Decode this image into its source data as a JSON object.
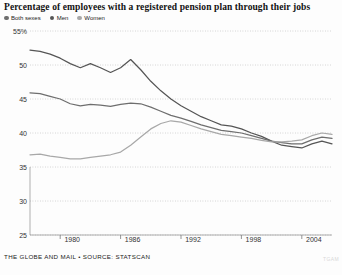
{
  "chart_data": {
    "type": "line",
    "title": "Percentage of employees with a registered pension plan through their jobs",
    "xlabel": "",
    "ylabel": "",
    "ylim": [
      25,
      55
    ],
    "xlim": [
      1977,
      2007
    ],
    "grid": true,
    "legend_position": "top-left",
    "yticks": [
      55,
      50,
      45,
      40,
      35,
      30,
      25
    ],
    "ytick_labels": [
      "55%",
      "50",
      "45",
      "40",
      "35",
      "30",
      "25"
    ],
    "xticks": [
      1980,
      1986,
      1992,
      1998,
      2004
    ],
    "xtick_labels": [
      "1980",
      "1986",
      "1992",
      "1998",
      "2004"
    ],
    "x": [
      1977,
      1978,
      1979,
      1980,
      1981,
      1982,
      1983,
      1984,
      1985,
      1986,
      1987,
      1988,
      1989,
      1990,
      1991,
      1992,
      1993,
      1994,
      1995,
      1996,
      1997,
      1998,
      1999,
      2000,
      2001,
      2002,
      2003,
      2004,
      2005,
      2006,
      2007
    ],
    "series": [
      {
        "name": "Men",
        "color": "#555555",
        "values": [
          52.2,
          52.0,
          51.6,
          51.0,
          50.2,
          49.6,
          50.2,
          49.6,
          48.9,
          49.6,
          50.8,
          49.3,
          47.6,
          46.2,
          45.0,
          44.0,
          43.2,
          42.4,
          41.8,
          41.2,
          41.0,
          40.6,
          40.0,
          39.5,
          38.8,
          38.2,
          38.0,
          37.8,
          38.4,
          38.8,
          38.4
        ]
      },
      {
        "name": "Both sexes",
        "color": "#6e6e6e",
        "values": [
          45.9,
          45.8,
          45.4,
          45.0,
          44.3,
          44.0,
          44.2,
          44.1,
          43.9,
          44.2,
          44.4,
          44.3,
          43.8,
          43.2,
          42.6,
          42.2,
          41.7,
          41.2,
          40.8,
          40.4,
          40.2,
          40.0,
          39.6,
          39.2,
          38.8,
          38.6,
          38.4,
          38.4,
          39.0,
          39.4,
          39.2
        ]
      },
      {
        "name": "Women",
        "color": "#a8a8a8",
        "values": [
          36.8,
          36.9,
          36.6,
          36.4,
          36.2,
          36.2,
          36.4,
          36.6,
          36.8,
          37.2,
          38.2,
          39.4,
          40.6,
          41.4,
          41.8,
          41.6,
          41.1,
          40.6,
          40.2,
          39.8,
          39.6,
          39.4,
          39.2,
          38.9,
          38.7,
          38.7,
          38.8,
          39.0,
          39.6,
          40.0,
          39.8
        ]
      }
    ]
  },
  "legend": {
    "items": [
      {
        "label": "Both sexes",
        "color": "#6e6e6e"
      },
      {
        "label": "Men",
        "color": "#555555"
      },
      {
        "label": "Women",
        "color": "#a8a8a8"
      }
    ]
  },
  "footer": {
    "credit": "THE GLOBE AND MAIL • SOURCE: STATSCAN",
    "watermark": "TGAM"
  }
}
